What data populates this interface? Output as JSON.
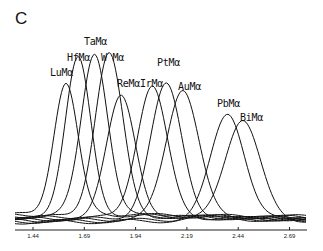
{
  "panel_label": "C",
  "chart_data": {
    "type": "line",
    "title": "",
    "xlabel": "",
    "ylabel": "",
    "xlim": [
      1.4,
      2.74
    ],
    "x_ticks": [
      1.44,
      1.69,
      1.94,
      2.19,
      2.44,
      2.69
    ],
    "x_tick_labels": [
      "1.44",
      "1.69",
      "1.94",
      "2.19",
      "2.44",
      "2.69"
    ],
    "grid": false,
    "legend": "none (peaks annotated directly)",
    "series": [
      {
        "name": "LuMα",
        "peak_x": 1.6,
        "peak_height": 0.79
      },
      {
        "name": "HfMα",
        "peak_x": 1.66,
        "peak_height": 0.94
      },
      {
        "name": "TaMα",
        "peak_x": 1.74,
        "peak_height": 0.98
      },
      {
        "name": "W Mα",
        "peak_x": 1.81,
        "peak_height": 0.98
      },
      {
        "name": "ReMα",
        "peak_x": 1.87,
        "peak_height": 0.72
      },
      {
        "name": "IrMα",
        "peak_x": 2.02,
        "peak_height": 0.79
      },
      {
        "name": "PtMα",
        "peak_x": 2.09,
        "peak_height": 0.8
      },
      {
        "name": "AuMα",
        "peak_x": 2.17,
        "peak_height": 0.78
      },
      {
        "name": "PbMα",
        "peak_x": 2.39,
        "peak_height": 0.63
      },
      {
        "name": "BiMα",
        "peak_x": 2.46,
        "peak_height": 0.6
      }
    ]
  },
  "labels": [
    {
      "text": "LuMα",
      "x": 50,
      "y": 67
    },
    {
      "text": "HfMα",
      "x": 67,
      "y": 52
    },
    {
      "text": "TaMα",
      "x": 84,
      "y": 36
    },
    {
      "text": "W Mα",
      "x": 101,
      "y": 52
    },
    {
      "text": "ReMα",
      "x": 117,
      "y": 78
    },
    {
      "text": "IrMα",
      "x": 140,
      "y": 78
    },
    {
      "text": "PtMα",
      "x": 157,
      "y": 57
    },
    {
      "text": "AuMα",
      "x": 178,
      "y": 81
    },
    {
      "text": "PbMα",
      "x": 217,
      "y": 98
    },
    {
      "text": "BiMα",
      "x": 240,
      "y": 112
    }
  ]
}
